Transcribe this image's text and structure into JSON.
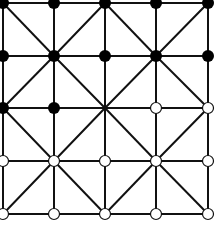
{
  "game": {
    "name": "Alquerque",
    "rows": 5,
    "cols": 5,
    "colors": {
      "background": "#ffffff",
      "line": "#111111",
      "black_piece": "#000000",
      "white_piece_fill": "#ffffff",
      "white_piece_stroke": "#111111"
    },
    "layout": {
      "x": [
        3,
        54,
        105,
        156,
        208
      ],
      "y": [
        3,
        56,
        108,
        161,
        214
      ],
      "piece_radius": 6,
      "line_width": 2
    },
    "board": [
      [
        "black",
        "black",
        "black",
        "black",
        "black"
      ],
      [
        "black",
        "black",
        "black",
        "black",
        "black"
      ],
      [
        "black",
        "black",
        "empty",
        "white",
        "white"
      ],
      [
        "white",
        "white",
        "white",
        "white",
        "white"
      ],
      [
        "white",
        "white",
        "white",
        "white",
        "white"
      ]
    ]
  }
}
